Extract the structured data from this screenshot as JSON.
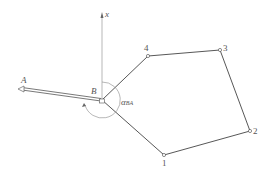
{
  "diagram": {
    "axis_label": "x",
    "points": {
      "A": {
        "label": "A",
        "x": 20,
        "y": 89
      },
      "B": {
        "label": "B",
        "x": 102,
        "y": 100
      },
      "p1": {
        "label": "1",
        "x": 164,
        "y": 155
      },
      "p2": {
        "label": "2",
        "x": 250,
        "y": 131
      },
      "p3": {
        "label": "3",
        "x": 220,
        "y": 50
      },
      "p4": {
        "label": "4",
        "x": 148,
        "y": 56
      }
    },
    "angle_label": {
      "main": "α",
      "sub": "BA"
    },
    "colors": {
      "line": "#444444",
      "axis": "#999999"
    }
  }
}
